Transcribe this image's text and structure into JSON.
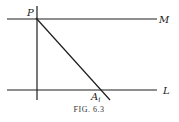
{
  "figure": {
    "caption": "Fig. 6.3",
    "caption_display": "FIG. 6.3",
    "lines": [
      {
        "name": "M",
        "type": "horizontal",
        "label": "M"
      },
      {
        "name": "L",
        "type": "horizontal",
        "label": "L"
      },
      {
        "name": "perpendicular",
        "type": "vertical",
        "label": ""
      },
      {
        "name": "transversal",
        "type": "diagonal",
        "from": "P",
        "to": "A_i"
      }
    ],
    "points": [
      {
        "name": "P",
        "label": "P",
        "on": [
          "M",
          "perpendicular",
          "transversal"
        ]
      },
      {
        "name": "A_i",
        "label": "A",
        "subscript": "i",
        "on": [
          "L",
          "transversal"
        ]
      }
    ],
    "labels": {
      "M": "M",
      "L": "L",
      "P": "P",
      "A": "A",
      "A_sub": "i"
    },
    "colors": {
      "ink": "#1e1e1e",
      "background": "#ffffff"
    }
  }
}
